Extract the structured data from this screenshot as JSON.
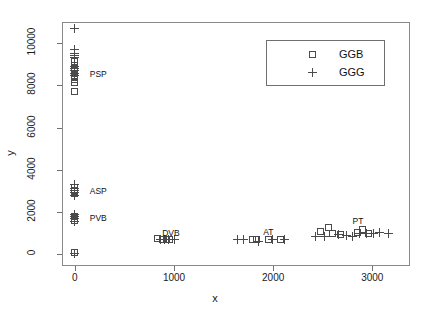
{
  "chart_data": {
    "type": "scatter",
    "title": "",
    "xlabel": "x",
    "ylabel": "y",
    "xlim": [
      -130,
      3380
    ],
    "ylim": [
      -560,
      11000
    ],
    "xticks": [
      0,
      1000,
      2000,
      3000
    ],
    "yticks": [
      0,
      2000,
      4000,
      6000,
      8000,
      10000
    ],
    "grid": false,
    "legend_position": "top-right",
    "legend": [
      {
        "label": "GGB",
        "marker": "square"
      },
      {
        "label": "GGG",
        "marker": "plus"
      }
    ],
    "annotations": [
      {
        "text": "PSP",
        "x": 150,
        "y": 8550
      },
      {
        "text": "ASP",
        "x": 150,
        "y": 3000
      },
      {
        "text": "PVB",
        "x": 150,
        "y": 1700
      },
      {
        "text": "DVB",
        "x": 880,
        "y": 1020
      },
      {
        "text": "AT",
        "x": 1900,
        "y": 1030
      },
      {
        "text": "PT",
        "x": 2800,
        "y": 1560
      }
    ],
    "series": [
      {
        "name": "GGB",
        "marker": "square",
        "points": [
          [
            0,
            9150
          ],
          [
            0,
            8950
          ],
          [
            0,
            8800
          ],
          [
            0,
            8680
          ],
          [
            0,
            8580
          ],
          [
            0,
            8480
          ],
          [
            0,
            8380
          ],
          [
            0,
            8280
          ],
          [
            0,
            8150
          ],
          [
            0,
            7700
          ],
          [
            0,
            3150
          ],
          [
            0,
            3040
          ],
          [
            0,
            2950
          ],
          [
            0,
            2870
          ],
          [
            0,
            1800
          ],
          [
            0,
            1700
          ],
          [
            0,
            1600
          ],
          [
            0,
            60
          ],
          [
            830,
            720
          ],
          [
            880,
            700
          ],
          [
            920,
            710
          ],
          [
            950,
            690
          ],
          [
            1790,
            700
          ],
          [
            1830,
            690
          ],
          [
            1950,
            700
          ],
          [
            2070,
            690
          ],
          [
            2480,
            1080
          ],
          [
            2560,
            1280
          ],
          [
            2600,
            1000
          ],
          [
            2680,
            950
          ],
          [
            2850,
            1030
          ],
          [
            2900,
            1180
          ],
          [
            2960,
            990
          ]
        ]
      },
      {
        "name": "GGG",
        "marker": "plus",
        "points": [
          [
            0,
            10680
          ],
          [
            0,
            9680
          ],
          [
            0,
            9500
          ],
          [
            0,
            9420
          ],
          [
            0,
            9320
          ],
          [
            0,
            8900
          ],
          [
            0,
            8780
          ],
          [
            0,
            8680
          ],
          [
            0,
            8560
          ],
          [
            0,
            8460
          ],
          [
            0,
            3280
          ],
          [
            0,
            3120
          ],
          [
            0,
            3000
          ],
          [
            0,
            2900
          ],
          [
            0,
            2800
          ],
          [
            0,
            1900
          ],
          [
            0,
            1780
          ],
          [
            0,
            1680
          ],
          [
            0,
            1560
          ],
          [
            0,
            30
          ],
          [
            860,
            700
          ],
          [
            900,
            690
          ],
          [
            940,
            710
          ],
          [
            1000,
            690
          ],
          [
            1640,
            680
          ],
          [
            1700,
            700
          ],
          [
            1850,
            620
          ],
          [
            1990,
            690
          ],
          [
            2110,
            700
          ],
          [
            2430,
            830
          ],
          [
            2520,
            860
          ],
          [
            2660,
            950
          ],
          [
            2740,
            900
          ],
          [
            2800,
            850
          ],
          [
            2870,
            1000
          ],
          [
            2940,
            980
          ],
          [
            3010,
            1000
          ],
          [
            3070,
            1010
          ],
          [
            3160,
            1000
          ]
        ]
      }
    ]
  }
}
